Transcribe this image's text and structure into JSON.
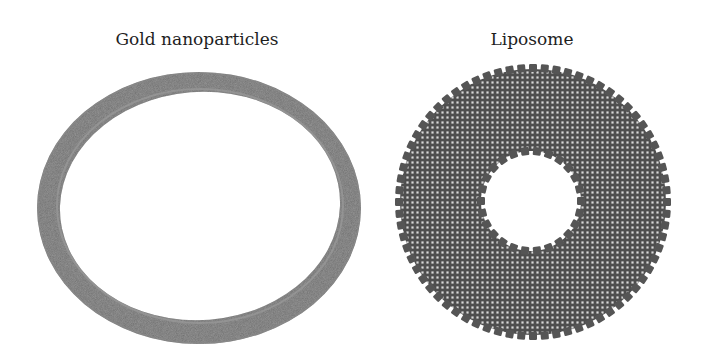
{
  "panels": [
    {
      "title": "Gold nanoparticles",
      "shape": "ring",
      "color": "#6e6e6e"
    },
    {
      "title": "Liposome",
      "shape": "bilayer-disc",
      "color": "#5a5a5a"
    }
  ]
}
